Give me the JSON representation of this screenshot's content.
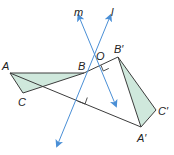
{
  "diagram": {
    "type": "geometry-rotation-reflection",
    "colors": {
      "line_axis": "#4a8fd6",
      "segment": "#3c3c3c",
      "triangle_fill": "#cfe8dc",
      "label": "#222222"
    },
    "labels": {
      "m": "m",
      "l": "l",
      "A": "A",
      "B": "B",
      "C": "C",
      "O": "O",
      "B_prime": "B′",
      "A_prime": "A′",
      "C_prime": "C′"
    },
    "points": {
      "A": [
        10,
        73
      ],
      "B": [
        84,
        73
      ],
      "C": [
        23,
        93
      ],
      "B_prime": [
        118,
        57
      ],
      "A_prime": [
        141,
        127
      ],
      "C_prime": [
        156,
        110
      ],
      "O": [
        104,
        63
      ]
    },
    "lines": {
      "m": {
        "from": [
          80,
          19
        ],
        "to": [
          116,
          106
        ]
      },
      "l": {
        "from": [
          109,
          19
        ],
        "to": [
          57,
          146
        ]
      }
    },
    "right_angle_marks": [
      {
        "at": [
          105,
          67
        ],
        "description": "m perpendicular to BB′ at O"
      },
      {
        "at": [
          80,
          96
        ],
        "description": "l perpendicular to AA′"
      }
    ]
  }
}
